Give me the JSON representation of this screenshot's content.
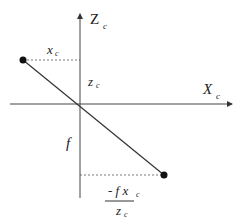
{
  "diagram": {
    "type": "pinhole camera projection geometry",
    "labels": {
      "z_axis": "Z",
      "z_axis_sub": "c",
      "x_axis": "X",
      "x_axis_sub": "c",
      "xc": "x",
      "xc_sub": "c",
      "zc": "z",
      "zc_sub": "c",
      "focal": "f",
      "proj_num": "- f x",
      "proj_num_sub": "c",
      "proj_den": "z",
      "proj_den_sub": "c"
    },
    "points": {
      "object_point": [
        23,
        60
      ],
      "image_point": [
        164,
        175
      ]
    },
    "colors": {
      "line": "#333333",
      "point": "#111111"
    }
  }
}
